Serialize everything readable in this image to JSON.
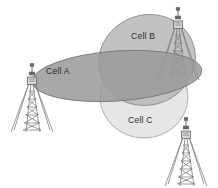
{
  "diagram": {
    "background_color": "#ffffff",
    "cells": [
      {
        "id": "cell-a",
        "label": "Cell A",
        "label_x": 46,
        "label_y": 74,
        "shape": "ellipse",
        "cx": 117,
        "cy": 76,
        "rx": 85,
        "ry": 25,
        "rotation": -4,
        "fill": "#9a9a9a",
        "stroke": "#6f6f6f",
        "opacity": 0.86
      },
      {
        "id": "cell-b",
        "label": "Cell B",
        "label_x": 131,
        "label_y": 39,
        "shape": "ellipse",
        "cx": 147,
        "cy": 60,
        "rx": 49,
        "ry": 45,
        "rotation": -22,
        "fill": "#b6b6b6",
        "stroke": "#8a8a8a",
        "opacity": 0.82
      },
      {
        "id": "cell-c",
        "label": "Cell C",
        "label_x": 128,
        "label_y": 123,
        "shape": "ellipse",
        "cx": 144,
        "cy": 97,
        "rx": 44,
        "ry": 41,
        "rotation": 0,
        "fill": "#e3e3e3",
        "stroke": "#9d9d9d",
        "opacity": 0.9
      }
    ],
    "towers": [
      {
        "id": "tower-left",
        "name": "tower-cell-a",
        "base_x": 32,
        "base_y": 132,
        "top_y": 72,
        "half_width": 22,
        "color": "#7a7a7a"
      },
      {
        "id": "tower-top-right",
        "name": "tower-cell-b",
        "base_x": 178,
        "base_y": 80,
        "top_y": 16,
        "half_width": 21,
        "color": "#7a7a7a"
      },
      {
        "id": "tower-bottom-right",
        "name": "tower-cell-c",
        "base_x": 186,
        "base_y": 186,
        "top_y": 126,
        "half_width": 22,
        "color": "#7a7a7a"
      }
    ],
    "colors": {
      "cell_a_fill": "#9a9a9a",
      "cell_b_fill": "#b6b6b6",
      "cell_c_fill": "#e3e3e3",
      "overlap_dark": "#808080",
      "tower_stroke": "#7a7a7a",
      "label_text": "#2b2b2b",
      "background": "#ffffff"
    }
  }
}
